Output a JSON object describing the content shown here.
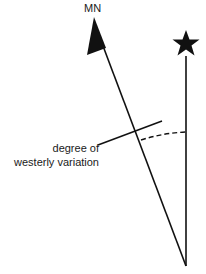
{
  "diagram": {
    "type": "magnetic declination diagram",
    "labels": {
      "magnetic_north": "MN",
      "variation_line1": "degree of",
      "variation_line2": "westerly variation"
    },
    "symbols": {
      "magnetic_north_marker": "arrowhead",
      "true_north_marker": "star"
    },
    "colors": {
      "ink": "#111111",
      "background": "#ffffff"
    }
  }
}
